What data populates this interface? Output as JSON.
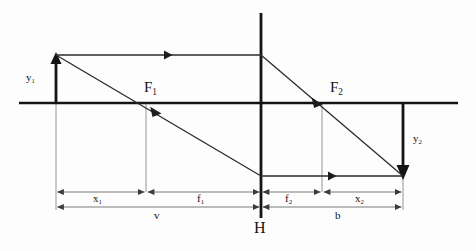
{
  "diagram": {
    "type": "optics-ray-diagram",
    "colors": {
      "axis": "#141414",
      "ray": "#2b2b2b",
      "dimension": "#6b6b6b",
      "guide": "#7d7d7d",
      "background": "#fdfdfd",
      "text": "#141414"
    },
    "labels": {
      "object_height": {
        "base": "y",
        "sub": "1",
        "x": 26,
        "y": 72
      },
      "image_height": {
        "base": "y",
        "sub": "2",
        "x": 413,
        "y": 138
      },
      "front_focal_point": {
        "base": "F",
        "sub": "1",
        "x": 144,
        "y": 88
      },
      "back_focal_point": {
        "base": "F",
        "sub": "2",
        "x": 330,
        "y": 88
      },
      "principal_plane": {
        "base": "H",
        "sub": "",
        "x": 255,
        "y": 222
      },
      "object_distance": {
        "base": "x",
        "sub": "1",
        "x": 94,
        "y": 196
      },
      "front_focal_length": {
        "base": "f",
        "sub": "1",
        "x": 197,
        "y": 196
      },
      "back_focal_length": {
        "base": "f",
        "sub": "2",
        "x": 286,
        "y": 196
      },
      "image_distance": {
        "base": "x",
        "sub": "2",
        "x": 357,
        "y": 196
      },
      "object_to_lens": {
        "base": "v",
        "sub": "",
        "x": 155,
        "y": 214
      },
      "lens_to_image": {
        "base": "b",
        "sub": "",
        "x": 336,
        "y": 214
      }
    },
    "geometry": {
      "optical_axis": {
        "x1": 19,
        "y1": 103,
        "x2": 458,
        "y2": 103
      },
      "principal_plane_line": {
        "x": 261,
        "y_top": 13,
        "y_bottom": 218
      },
      "object_arrow": {
        "x": 56,
        "y_base": 103,
        "y_tip": 55
      },
      "image_arrow": {
        "x": 403,
        "y_base": 103,
        "y_tip": 176
      },
      "ray_parallel_in": {
        "x1": 56,
        "y1": 55,
        "x2": 261,
        "y2": 55
      },
      "ray_parallel_out": {
        "x1": 261,
        "y1": 55,
        "x2": 403,
        "y2": 176
      },
      "ray_through_focus": {
        "x1": 56,
        "y1": 55,
        "x2": 261,
        "y2": 176
      },
      "ray_parallel_after": {
        "x1": 261,
        "y1": 176,
        "x2": 403,
        "y2": 176
      },
      "focal_point_front": {
        "x": 146,
        "y": 103
      },
      "focal_point_back": {
        "x": 322,
        "y": 103
      },
      "guide_lines": [
        {
          "x": 56,
          "y1": 103,
          "y2": 210
        },
        {
          "x": 146,
          "y1": 103,
          "y2": 192
        },
        {
          "x": 322,
          "y1": 103,
          "y2": 192
        },
        {
          "x": 403,
          "y1": 176,
          "y2": 210
        }
      ],
      "dimension_rows": [
        {
          "y": 192,
          "segments": [
            {
              "name": "x1",
              "x1": 56,
              "x2": 146
            },
            {
              "name": "f1",
              "x1": 146,
              "x2": 261
            },
            {
              "name": "f2",
              "x1": 261,
              "x2": 322
            },
            {
              "name": "x2",
              "x1": 322,
              "x2": 403
            }
          ]
        },
        {
          "y": 207,
          "segments": [
            {
              "name": "v",
              "x1": 56,
              "x2": 261
            },
            {
              "name": "b",
              "x1": 261,
              "x2": 403
            }
          ]
        }
      ]
    }
  }
}
